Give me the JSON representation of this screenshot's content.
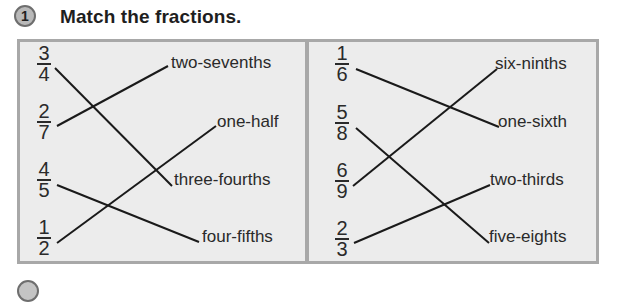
{
  "exercise": {
    "number": "1",
    "title": "Match the fractions."
  },
  "panels": [
    {
      "fractions": [
        {
          "numerator": "3",
          "denominator": "4"
        },
        {
          "numerator": "2",
          "denominator": "7"
        },
        {
          "numerator": "4",
          "denominator": "5"
        },
        {
          "numerator": "1",
          "denominator": "2"
        }
      ],
      "words": [
        "two-sevenths",
        "one-half",
        "three-fourths",
        "four-fifths"
      ],
      "matches": [
        {
          "fraction": "3/4",
          "word": "three-fourths"
        },
        {
          "fraction": "2/7",
          "word": "two-sevenths"
        },
        {
          "fraction": "4/5",
          "word": "four-fifths"
        },
        {
          "fraction": "1/2",
          "word": "one-half"
        }
      ]
    },
    {
      "fractions": [
        {
          "numerator": "1",
          "denominator": "6"
        },
        {
          "numerator": "5",
          "denominator": "8"
        },
        {
          "numerator": "6",
          "denominator": "9"
        },
        {
          "numerator": "2",
          "denominator": "3"
        }
      ],
      "words": [
        "six-ninths",
        "one-sixth",
        "two-thirds",
        "five-eights"
      ],
      "matches": [
        {
          "fraction": "1/6",
          "word": "one-sixth"
        },
        {
          "fraction": "5/8",
          "word": "five-eights"
        },
        {
          "fraction": "6/9",
          "word": "six-ninths"
        },
        {
          "fraction": "2/3",
          "word": "two-thirds"
        }
      ]
    }
  ],
  "next_exercise_number": "2"
}
